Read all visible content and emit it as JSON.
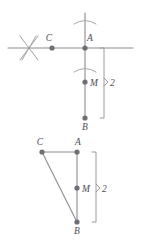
{
  "figure": {
    "stroke_color": "#8c8c92",
    "dot_color": "#6e6e76",
    "label_color": "#4d4d55",
    "background_color": "#ffffff"
  },
  "top_diagram": {
    "name": "construction-with-compass-arcs",
    "labels": {
      "point_c": "C",
      "point_a": "A",
      "point_m": "M",
      "point_b": "B",
      "measure": "2"
    },
    "points": [
      {
        "id": "C",
        "label": "C",
        "x": 52,
        "y": 48
      },
      {
        "id": "A",
        "label": "A",
        "x": 85,
        "y": 48
      },
      {
        "id": "M",
        "label": "M",
        "x": 85,
        "y": 82
      },
      {
        "id": "B",
        "label": "B",
        "x": 85,
        "y": 118
      }
    ],
    "horizontal_line": {
      "x1": 8,
      "y1": 48,
      "x2": 133,
      "y2": 48
    },
    "vertical_line": {
      "x1": 85,
      "y1": 13,
      "x2": 85,
      "y2": 118
    },
    "cross_mark": {
      "center_x": 29,
      "center_y": 48,
      "size": 13
    },
    "arcs": [
      {
        "id": "arc-above-a",
        "cx": 85,
        "cy": 22,
        "rx": 11,
        "ry": 4
      },
      {
        "id": "arc-above-m",
        "cx": 85,
        "cy": 70,
        "rx": 11,
        "ry": 4
      }
    ],
    "bracket": {
      "x": 104,
      "y_top": 48,
      "y_bottom": 118,
      "pointer_y": 82
    }
  },
  "bottom_diagram": {
    "name": "triangle-with-median",
    "labels": {
      "point_c": "C",
      "point_a": "A",
      "point_m": "M",
      "point_b": "B",
      "measure": "2"
    },
    "points": [
      {
        "id": "C",
        "label": "C",
        "x": 42,
        "y": 152
      },
      {
        "id": "A",
        "label": "A",
        "x": 77,
        "y": 152
      },
      {
        "id": "M",
        "label": "M",
        "x": 77,
        "y": 188
      },
      {
        "id": "B",
        "label": "B",
        "x": 77,
        "y": 222
      }
    ],
    "segments": [
      {
        "id": "CA",
        "x1": 42,
        "y1": 152,
        "x2": 77,
        "y2": 152
      },
      {
        "id": "AB",
        "x1": 77,
        "y1": 152,
        "x2": 77,
        "y2": 222
      },
      {
        "id": "CB",
        "x1": 42,
        "y1": 152,
        "x2": 77,
        "y2": 222
      }
    ],
    "bracket": {
      "x": 96,
      "y_top": 152,
      "y_bottom": 222,
      "pointer_y": 188
    }
  }
}
